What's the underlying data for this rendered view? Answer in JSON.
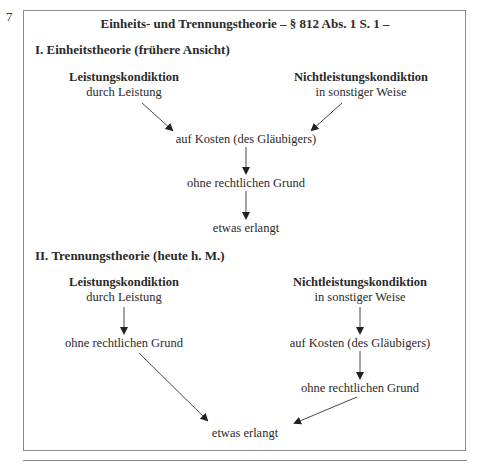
{
  "margin_number": "7",
  "title": "Einheits- und Trennungstheorie – § 812 Abs. 1 S. 1 –",
  "section1": {
    "heading": "I. Einheitstheorie (frühere Ansicht)",
    "left": {
      "title": "Leistungskondiktion",
      "sub": "durch Leistung"
    },
    "right": {
      "title": "Nichtleistungskondiktion",
      "sub": "in sonstiger Weise"
    },
    "node1": "auf Kosten (des Gläubigers)",
    "node2": "ohne rechtlichen Grund",
    "node3": "etwas erlangt"
  },
  "section2": {
    "heading": "II. Trennungstheorie (heute h. M.)",
    "left": {
      "title": "Leistungskondiktion",
      "sub": "durch Leistung",
      "node1": "ohne rechtlichen Grund"
    },
    "right": {
      "title": "Nichtleistungskondiktion",
      "sub": "in sonstiger Weise",
      "node1": "auf Kosten (des Gläubigers)",
      "node2": "ohne rechtlichen Grund"
    },
    "result": "etwas erlangt"
  },
  "colors": {
    "text": "#2a2a2a",
    "border": "#8a8a8a",
    "arrow": "#222222"
  }
}
